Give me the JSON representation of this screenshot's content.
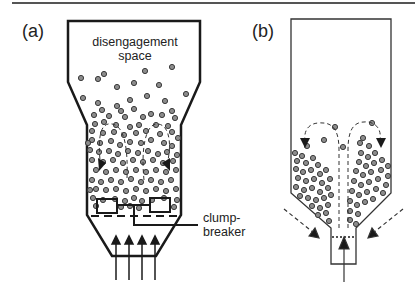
{
  "figure": {
    "panel_a": {
      "label": "(a)",
      "top_region_label_line1": "disengagement",
      "top_region_label_line2": "space",
      "clump_breaker_label_line1": "clump-",
      "clump_breaker_label_line2": "breaker"
    },
    "panel_b": {
      "label": "(b)"
    }
  },
  "colors": {
    "outline": "#1a1a1a",
    "particle_fill": "#8c8c8c",
    "particle_stroke": "#3a3a3a",
    "background": "#ffffff"
  }
}
